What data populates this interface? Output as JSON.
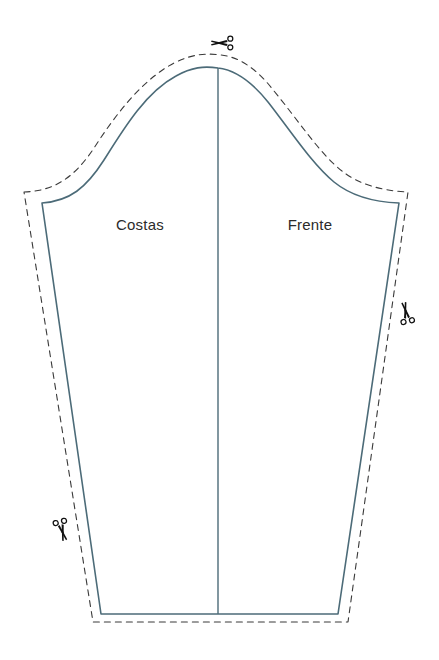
{
  "document": {
    "type": "sewing-pattern-diagram",
    "title": "Molde de Manga",
    "background_color": "#ffffff",
    "width": 439,
    "height": 660
  },
  "colors": {
    "seam_line": "#4c6b78",
    "cut_line": "#3a3a3a",
    "label_text": "#2b2b2b",
    "scissors": "#111111",
    "page_background": "#ffffff"
  },
  "labels": {
    "back_panel": "Costas",
    "front_panel": "Frente"
  },
  "label_positions": {
    "back_panel": {
      "x": 140,
      "y": 230
    },
    "front_panel": {
      "x": 310,
      "y": 230
    }
  },
  "lines": {
    "seam_line": {
      "name": "sleeve-seam-line",
      "style": "solid",
      "width": 1.6,
      "color": "#4c6b78"
    },
    "cut_line": {
      "name": "sleeve-cut-line",
      "style": "dashed",
      "width": 1.1,
      "color": "#3a3a3a",
      "dash_pattern": "6 5"
    },
    "grain_line": {
      "name": "sleeve-center-grain-line",
      "style": "solid",
      "width": 1.4,
      "color": "#4c6b78",
      "x": 218,
      "y_top": 68,
      "y_bottom": 614
    }
  },
  "geometry": {
    "seam_outline_path": "M 42 203 L 42 203 C 70 201 86 188 104 160 C 124 128 146 92 176 76 C 192 67 204 66 218 68 C 236 70 252 82 268 102 C 290 130 312 164 334 182 C 350 195 372 202 399 203 L 399 203 L 338 614 L 101 614 Z",
    "cut_outline_path": "M 24 192 C 54 191 74 178 94 148 C 116 114 142 80 174 63 C 192 54 206 53 221 55 C 240 57 258 70 274 91 C 298 120 320 154 342 171 C 358 184 382 191 408 192 L 348 622 L 93 622 Z",
    "seam_cap_apex": {
      "x": 218,
      "y": 68
    },
    "seam_corners": {
      "top_left": {
        "x": 42,
        "y": 203
      },
      "top_right": {
        "x": 399,
        "y": 203
      },
      "bottom_left": {
        "x": 101,
        "y": 614
      },
      "bottom_right": {
        "x": 338,
        "y": 614
      }
    },
    "cut_corners": {
      "top_left": {
        "x": 24,
        "y": 192
      },
      "top_right": {
        "x": 408,
        "y": 192
      },
      "bottom_left": {
        "x": 93,
        "y": 622
      },
      "bottom_right": {
        "x": 348,
        "y": 622
      }
    },
    "seam_allowance_px": 10
  },
  "scissors_markers": [
    {
      "name": "scissors-marker-top",
      "icon": "scissors-icon",
      "x": 222,
      "y": 43,
      "rotation": 0,
      "size": 20
    },
    {
      "name": "scissors-marker-right",
      "icon": "scissors-icon",
      "x": 406,
      "y": 313,
      "rotation": 78,
      "size": 20
    },
    {
      "name": "scissors-marker-bottom-left",
      "icon": "scissors-icon",
      "x": 62,
      "y": 530,
      "rotation": 255,
      "size": 20
    }
  ]
}
